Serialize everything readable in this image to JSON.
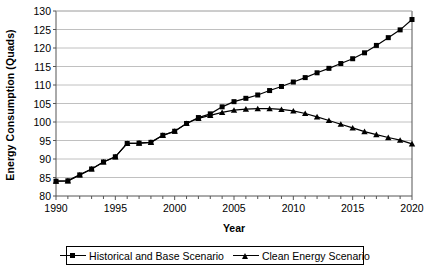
{
  "chart_data": {
    "type": "line",
    "title": "",
    "xlabel": "Year",
    "ylabel": "Energy Consumption (Quads)",
    "xlim": [
      1990,
      2020
    ],
    "ylim": [
      80,
      130
    ],
    "ytick_step": 5,
    "xtick_step": 5,
    "x_minor_tick_step": 1,
    "grid": "horizontal",
    "legend_position": "bottom",
    "yticks": [
      80,
      85,
      90,
      95,
      100,
      105,
      110,
      115,
      120,
      125,
      130
    ],
    "xticks": [
      1990,
      1995,
      2000,
      2005,
      2010,
      2015,
      2020
    ],
    "x": [
      1990,
      1991,
      1992,
      1993,
      1994,
      1995,
      1996,
      1997,
      1998,
      1999,
      2000,
      2001,
      2002,
      2003,
      2004,
      2005,
      2006,
      2007,
      2008,
      2009,
      2010,
      2011,
      2012,
      2013,
      2014,
      2015,
      2016,
      2017,
      2018,
      2019,
      2020
    ],
    "series": [
      {
        "name": "Historical and Base Scenario",
        "marker": "square",
        "color": "#000000",
        "values": [
          84.0,
          84.1,
          85.7,
          87.3,
          89.2,
          90.6,
          94.2,
          94.3,
          94.5,
          96.4,
          97.5,
          99.6,
          101.2,
          102.2,
          104.1,
          105.5,
          106.4,
          107.3,
          108.5,
          109.6,
          110.8,
          112.0,
          113.3,
          114.5,
          115.8,
          117.1,
          118.7,
          120.7,
          122.8,
          124.9,
          127.7
        ]
      },
      {
        "name": "Clean Energy Scenario",
        "marker": "triangle",
        "color": "#000000",
        "values": [
          84.0,
          84.1,
          85.7,
          87.3,
          89.2,
          90.6,
          94.2,
          94.3,
          94.5,
          96.4,
          97.5,
          99.6,
          101.0,
          101.8,
          102.6,
          103.2,
          103.5,
          103.6,
          103.6,
          103.4,
          103.0,
          102.3,
          101.4,
          100.4,
          99.4,
          98.4,
          97.4,
          96.6,
          95.8,
          95.1,
          94.1
        ]
      }
    ]
  },
  "legend": {
    "items": [
      {
        "label": "Historical and Base Scenario",
        "marker": "square-marker-icon"
      },
      {
        "label": "Clean Energy Scenario",
        "marker": "triangle-marker-icon"
      }
    ]
  }
}
